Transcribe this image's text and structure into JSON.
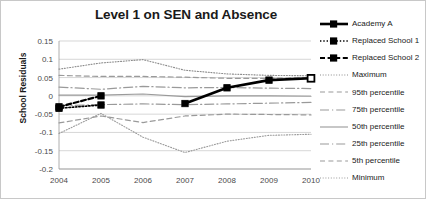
{
  "chart_data": {
    "type": "line",
    "title": "Level 1 on SEN and Absence",
    "xlabel": "",
    "ylabel": "School Residuals",
    "x": [
      2004,
      2005,
      2006,
      2007,
      2008,
      2009,
      2010
    ],
    "xticklabels": [
      "2004",
      "2005",
      "2006",
      "2007",
      "2008",
      "2009",
      "2010"
    ],
    "yticklabels": [
      "0.15",
      "0.1",
      "0.05",
      "0",
      "-0.05",
      "-0.1",
      "-0.15",
      "-0.2"
    ],
    "yticks": [
      0.15,
      0.1,
      0.05,
      0,
      -0.05,
      -0.1,
      -0.15,
      -0.2
    ],
    "ylim": [
      -0.2,
      0.15
    ],
    "xlim": [
      2004,
      2010
    ],
    "grid": true,
    "legend_position": "right",
    "series": [
      {
        "name": "Academy A",
        "style": "solid-thick-marker",
        "color": "#000000",
        "x": [
          2007,
          2008,
          2009,
          2010
        ],
        "values": [
          -0.021,
          0.022,
          0.043,
          0.048
        ]
      },
      {
        "name": "Replaced School 1",
        "style": "dotted-marker",
        "color": "#000000",
        "x": [
          2004,
          2005
        ],
        "values": [
          -0.034,
          -0.025
        ]
      },
      {
        "name": "Replaced School 2",
        "style": "dashed-marker",
        "color": "#000000",
        "x": [
          2004,
          2005
        ],
        "values": [
          -0.03,
          0.0
        ]
      },
      {
        "name": "Maximum",
        "style": "fine-dotted",
        "color": "#8c8c8c",
        "x": [
          2004,
          2005,
          2006,
          2007,
          2008,
          2009,
          2010
        ],
        "values": [
          0.073,
          0.09,
          0.099,
          0.07,
          0.06,
          0.056,
          0.055
        ]
      },
      {
        "name": "95th percentile",
        "style": "dashed",
        "color": "#9a9a9a",
        "x": [
          2004,
          2005,
          2006,
          2007,
          2008,
          2009,
          2010
        ],
        "values": [
          0.056,
          0.053,
          0.053,
          0.051,
          0.048,
          0.048,
          0.05
        ]
      },
      {
        "name": "75th percentile",
        "style": "dash-dot",
        "color": "#9a9a9a",
        "x": [
          2004,
          2005,
          2006,
          2007,
          2008,
          2009,
          2010
        ],
        "values": [
          0.024,
          0.018,
          0.026,
          0.022,
          0.023,
          0.021,
          0.02
        ]
      },
      {
        "name": "50th percentile",
        "style": "solid",
        "color": "#9a9a9a",
        "x": [
          2004,
          2005,
          2006,
          2007,
          2008,
          2009,
          2010
        ],
        "values": [
          0.002,
          0.002,
          0.005,
          -0.002,
          0.0,
          0.0,
          -0.001
        ]
      },
      {
        "name": "25th  percentile",
        "style": "dash-dot",
        "color": "#9a9a9a",
        "x": [
          2004,
          2005,
          2006,
          2007,
          2008,
          2009,
          2010
        ],
        "values": [
          -0.027,
          -0.024,
          -0.022,
          -0.024,
          -0.022,
          -0.02,
          -0.018
        ]
      },
      {
        "name": "5th percentile",
        "style": "dashed",
        "color": "#9a9a9a",
        "x": [
          2004,
          2005,
          2006,
          2007,
          2008,
          2009,
          2010
        ],
        "values": [
          -0.074,
          -0.055,
          -0.073,
          -0.055,
          -0.05,
          -0.051,
          -0.052
        ]
      },
      {
        "name": "Minimum",
        "style": "fine-dotted",
        "color": "#9a9a9a",
        "x": [
          2004,
          2005,
          2006,
          2007,
          2008,
          2009,
          2010
        ],
        "values": [
          -0.103,
          -0.048,
          -0.113,
          -0.155,
          -0.124,
          -0.108,
          -0.105
        ]
      }
    ]
  }
}
